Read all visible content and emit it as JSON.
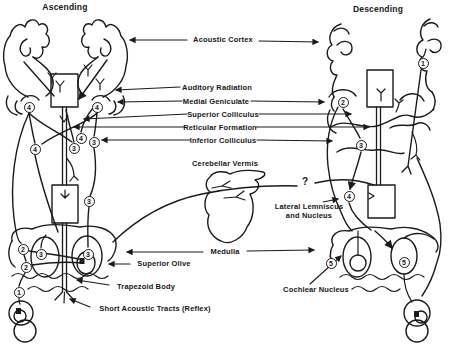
{
  "diagram": {
    "title_left": "Ascending",
    "title_right": "Descending",
    "labels": {
      "acoustic_cortex": "Acoustic Cortex",
      "auditory_radiation": "Auditory Radiation",
      "medial_geniculate": "Medial Geniculate",
      "superior_colliculus": "Superior Colliculus",
      "reticular_formation": "Reticular Formation",
      "inferior_colliculus": "Inferior Colliculus",
      "cerebellar_vermis": "Cerebellar Vermis",
      "lateral_lemniscus_line1": "Lateral Lemniscus",
      "lateral_lemniscus_line2": "and Nucleus",
      "medulla": "Medulla",
      "superior_olive": "Superior Olive",
      "trapezoid_body": "Trapezoid Body",
      "short_acoustic_tracts": "Short Acoustic Tracts (Reflex)",
      "cochlear_nucleus": "Cochlear Nucleus",
      "uncertain_pathway": "?"
    },
    "neuron_order_markers": [
      {
        "n": "4",
        "x": 29,
        "y": 107
      },
      {
        "n": "4",
        "x": 97,
        "y": 107
      },
      {
        "n": "4",
        "x": 81,
        "y": 138
      },
      {
        "n": "3",
        "x": 94,
        "y": 142
      },
      {
        "n": "3",
        "x": 74,
        "y": 148
      },
      {
        "n": "4",
        "x": 35,
        "y": 149
      },
      {
        "n": "3",
        "x": 89,
        "y": 201
      },
      {
        "n": "2",
        "x": 23,
        "y": 249
      },
      {
        "n": "3",
        "x": 41,
        "y": 254
      },
      {
        "n": "3",
        "x": 88,
        "y": 254
      },
      {
        "n": "2",
        "x": 26,
        "y": 267
      },
      {
        "n": "1",
        "x": 19,
        "y": 292
      },
      {
        "n": "1",
        "x": 423,
        "y": 63
      },
      {
        "n": "2",
        "x": 343,
        "y": 102
      },
      {
        "n": "3",
        "x": 361,
        "y": 145
      },
      {
        "n": "4",
        "x": 349,
        "y": 196
      },
      {
        "n": "5",
        "x": 331,
        "y": 263
      },
      {
        "n": "5",
        "x": 404,
        "y": 262
      }
    ],
    "colors": {
      "ink": "#1a1a1a",
      "background": "#ffffff"
    }
  }
}
